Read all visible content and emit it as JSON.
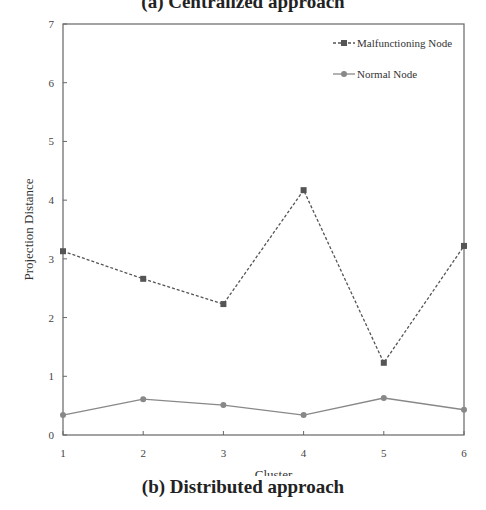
{
  "caption": "(b) Distributed approach",
  "top_caption_partial": "(a) Centralized approach",
  "chart_data": {
    "type": "line",
    "title": "",
    "xlabel": "Cluster",
    "ylabel": "Projection Distance",
    "x": [
      1,
      2,
      3,
      4,
      5,
      6
    ],
    "xticks": [
      "1",
      "2",
      "3",
      "4",
      "5",
      "6"
    ],
    "yticks": [
      "0",
      "1",
      "2",
      "3",
      "4",
      "5",
      "6",
      "7"
    ],
    "ylim": [
      0,
      7
    ],
    "xlim": [
      1,
      6
    ],
    "grid": false,
    "legend_position": "upper right",
    "series": [
      {
        "name": "Malfunctioning Node",
        "marker": "square",
        "line": "dashed",
        "color": "#555555",
        "values": [
          3.13,
          2.66,
          2.23,
          4.17,
          1.23,
          3.22
        ]
      },
      {
        "name": "Normal Node",
        "marker": "circle",
        "line": "solid",
        "color": "#888888",
        "values": [
          0.34,
          0.61,
          0.51,
          0.34,
          0.63,
          0.43
        ]
      }
    ]
  }
}
